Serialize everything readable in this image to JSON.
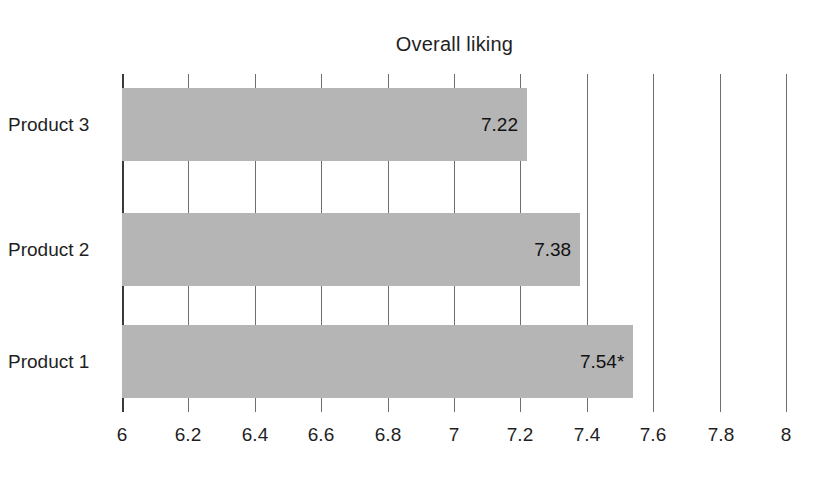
{
  "chart_data": {
    "type": "bar",
    "orientation": "horizontal",
    "title": "Overall liking",
    "xlabel": "",
    "ylabel": "",
    "categories": [
      "Product 1",
      "Product 2",
      "Product 3"
    ],
    "values": [
      7.54,
      7.38,
      7.22
    ],
    "data_labels": [
      "7.54*",
      "7.38",
      "7.22"
    ],
    "series": [
      {
        "name": "Overall liking",
        "values": [
          7.54,
          7.38,
          7.22
        ],
        "color": "#b5b5b5"
      }
    ],
    "xlim": [
      6,
      8
    ],
    "xticks": [
      6,
      6.2,
      6.4,
      6.6,
      6.8,
      7,
      7.2,
      7.4,
      7.6,
      7.8,
      8
    ],
    "xtick_labels": [
      "6",
      "6.2",
      "6.4",
      "6.6",
      "6.8",
      "7",
      "7.2",
      "7.4",
      "7.6",
      "7.8",
      "8"
    ],
    "grid": true,
    "grid_axis": "x",
    "legend": false,
    "annotations": [
      "* indicates significance marker on Product 1"
    ]
  },
  "bars": [
    {
      "category": "Product 3",
      "value": 7.22,
      "label": "7.22"
    },
    {
      "category": "Product 2",
      "value": 7.38,
      "label": "7.38"
    },
    {
      "category": "Product 1",
      "value": 7.54,
      "label": "7.54*"
    }
  ],
  "colors": {
    "bar_fill": "#b5b5b5",
    "gridline": "#6e6e6e",
    "axis_line": "#3a3a3a",
    "text": "#1f1f1f",
    "background": "#ffffff"
  }
}
